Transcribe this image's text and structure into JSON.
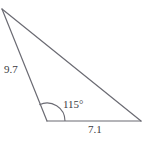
{
  "figure": {
    "kind": "geometry-diagram",
    "shape": "triangle",
    "background_color": "#ffffff",
    "stroke_color": "#6b6b73",
    "text_color": "#3b3b40",
    "stroke_width": 1.2,
    "vertices": {
      "apex": [
        2,
        9
      ],
      "bottom_left": [
        47,
        121
      ],
      "bottom_right": [
        141,
        121
      ]
    },
    "angle_arc": {
      "at_vertex": "bottom_left",
      "radius": 18,
      "start_angle_deg": 0,
      "end_angle_deg": 115
    }
  },
  "labels": {
    "side_left": "9.7",
    "angle": "115°",
    "side_base": "7.1"
  }
}
